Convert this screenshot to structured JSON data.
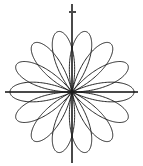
{
  "figure": {
    "background_color": "#ffffff",
    "width": 143,
    "height": 166,
    "title": "",
    "caption": ""
  },
  "axes": {
    "color": "#4a4a4a",
    "origin": {
      "x": 72,
      "y": 92
    },
    "x_axis": {
      "label": "",
      "start_x": 5,
      "end_x": 138,
      "y": 92
    },
    "y_axis": {
      "label": "",
      "start_y": 4,
      "end_y": 163,
      "x": 72
    },
    "ticks": [
      {
        "name": "y-upper-tick",
        "axis": "y",
        "x": 72,
        "y": 12,
        "length": 7
      }
    ],
    "grid": "off"
  },
  "chart_data": {
    "type": "line",
    "title": "",
    "subtitle": "",
    "xlabel": "",
    "ylabel": "",
    "coordinate_system": "polar",
    "curve_name": "seven-petal rose",
    "equation": "r = a*cos(7*theta/2)",
    "petal_count": 7,
    "amplitude_px": 62,
    "theta_range_radians": [
      0,
      12.566370614
    ],
    "theta_range_label": "0 to 4*pi",
    "stroke_color": "#1c1c1c",
    "stroke_width": 0.95,
    "fill": "none",
    "legend": [],
    "annotations": [],
    "petal_tip_angles_deg": [
      90,
      141.43,
      192.86,
      244.29,
      295.71,
      347.14,
      38.57
    ],
    "petal_tips_px": [
      {
        "label": "petal-1-top",
        "x": 72,
        "y": 30
      },
      {
        "label": "petal-2-upper-left",
        "x": 23.6,
        "y": 53.3
      },
      {
        "label": "petal-3-lower-left",
        "x": 11.5,
        "y": 105.8
      },
      {
        "label": "petal-4-bottom-left",
        "x": 45.1,
        "y": 147.9
      },
      {
        "label": "petal-5-bottom-right",
        "x": 98.9,
        "y": 147.9
      },
      {
        "label": "petal-6-lower-right",
        "x": 132.5,
        "y": 105.8
      },
      {
        "label": "petal-7-upper-right",
        "x": 120.4,
        "y": 53.3
      }
    ],
    "xlim": [
      -62,
      62
    ],
    "ylim": [
      -62,
      62
    ],
    "samples": 1600
  }
}
